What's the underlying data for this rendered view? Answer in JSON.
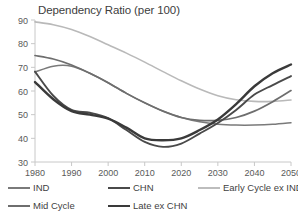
{
  "chart_data": {
    "type": "line",
    "title": "Dependency Ratio (per 100)",
    "xlabel": "",
    "ylabel": "",
    "xlim": [
      1980,
      2050
    ],
    "ylim": [
      30,
      90
    ],
    "grid": false,
    "legend_position": "bottom",
    "x": [
      1980,
      1985,
      1990,
      1995,
      2000,
      2005,
      2010,
      2015,
      2020,
      2025,
      2030,
      2035,
      2040,
      2045,
      2050
    ],
    "xticks": [
      "1980",
      "1990",
      "2000",
      "2010",
      "2020",
      "2030",
      "2040",
      "2050"
    ],
    "yticks": [
      "30",
      "40",
      "50",
      "60",
      "70",
      "80",
      "90"
    ],
    "series": [
      {
        "name": "IND",
        "color": "#7a7a7a",
        "width": 1.5,
        "values": [
          68.0,
          70.5,
          70.5,
          67.5,
          63.5,
          59.0,
          55.0,
          51.5,
          48.8,
          47.0,
          46.0,
          45.6,
          45.6,
          45.9,
          46.6
        ]
      },
      {
        "name": "CHN",
        "color": "#4a4a4a",
        "width": 1.9,
        "values": [
          68.2,
          58.0,
          52.0,
          50.8,
          48.5,
          43.5,
          38.5,
          36.4,
          37.8,
          42.0,
          46.5,
          52.0,
          58.5,
          62.5,
          66.3
        ]
      },
      {
        "name": "Early Cycle ex IND",
        "color": "#b9b9b9",
        "width": 1.6,
        "values": [
          89.2,
          88.0,
          86.0,
          83.0,
          79.5,
          76.0,
          72.2,
          68.2,
          64.3,
          60.8,
          58.0,
          56.3,
          55.6,
          55.6,
          56.2
        ]
      },
      {
        "name": "Mid Cycle",
        "color": "#6e6e6e",
        "width": 1.7,
        "values": [
          75.0,
          73.5,
          71.0,
          67.5,
          63.5,
          59.0,
          55.0,
          51.5,
          48.8,
          47.6,
          47.6,
          48.8,
          51.5,
          55.5,
          60.2
        ]
      },
      {
        "name": "Late ex CHN",
        "color": "#3a3a3a",
        "width": 2.4,
        "values": [
          63.8,
          56.5,
          51.5,
          50.0,
          48.3,
          44.5,
          40.0,
          39.2,
          40.0,
          43.5,
          48.0,
          54.5,
          62.0,
          67.5,
          71.2
        ]
      }
    ]
  },
  "axis": {
    "y_tick_labels": [
      "90",
      "80",
      "70",
      "60",
      "50",
      "40",
      "30"
    ],
    "x_tick_labels": [
      "1980",
      "1990",
      "2000",
      "2010",
      "2020",
      "2030",
      "2040",
      "2050"
    ]
  },
  "legend": {
    "items": [
      {
        "label": "IND",
        "color": "#7a7a7a",
        "width": 1.5
      },
      {
        "label": "CHN",
        "color": "#4a4a4a",
        "width": 2.0
      },
      {
        "label": "Early Cycle ex IND",
        "color": "#bdbdbd",
        "width": 1.6
      },
      {
        "label": "Mid Cycle",
        "color": "#6e6e6e",
        "width": 1.7
      },
      {
        "label": "Late ex CHN",
        "color": "#3a3a3a",
        "width": 2.5
      }
    ]
  }
}
